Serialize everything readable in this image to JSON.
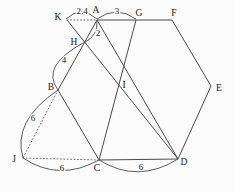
{
  "figure": {
    "canvas": {
      "width": 235,
      "height": 193
    },
    "colors": {
      "background": "#fcfcfc",
      "stroke": "#4a4a4a",
      "stroke_dotted": "#6b6b6b",
      "label": "#171717"
    },
    "points": {
      "K": {
        "x": 67,
        "y": 20
      },
      "A": {
        "x": 97,
        "y": 20
      },
      "G": {
        "x": 136,
        "y": 20
      },
      "F": {
        "x": 172,
        "y": 20
      },
      "H": {
        "x": 84.6,
        "y": 42.3
      },
      "B": {
        "x": 58,
        "y": 90
      },
      "I": {
        "x": 118,
        "y": 84.3
      },
      "E": {
        "x": 211,
        "y": 86
      },
      "J": {
        "x": 23,
        "y": 158
      },
      "C": {
        "x": 99,
        "y": 160
      },
      "D": {
        "x": 178,
        "y": 159
      }
    },
    "point_labels": [
      {
        "text": "K",
        "x": 58,
        "y": 17
      },
      {
        "text": "A",
        "x": 96,
        "y": 10
      },
      {
        "text": "G",
        "x": 139,
        "y": 13
      },
      {
        "text": "F",
        "x": 174,
        "y": 13
      },
      {
        "text": "H",
        "x": 74,
        "y": 42
      },
      {
        "text": "B",
        "x": 51,
        "y": 87
      },
      {
        "text": "I",
        "x": 124,
        "y": 85
      },
      {
        "text": "E",
        "x": 219,
        "y": 88
      },
      {
        "text": "J",
        "x": 14,
        "y": 159
      },
      {
        "text": "C",
        "x": 97,
        "y": 168
      },
      {
        "text": "D",
        "x": 184,
        "y": 162
      }
    ],
    "segments": [
      {
        "from": "A",
        "to": "F",
        "style": "solid"
      },
      {
        "from": "F",
        "to": "E",
        "style": "solid"
      },
      {
        "from": "E",
        "to": "D",
        "style": "solid"
      },
      {
        "from": "D",
        "to": "C",
        "style": "solid"
      },
      {
        "from": "C",
        "to": "B",
        "style": "solid"
      },
      {
        "from": "B",
        "to": "A",
        "style": "solid"
      },
      {
        "from": "K",
        "to": "D",
        "style": "solid"
      },
      {
        "from": "G",
        "to": "C",
        "style": "solid"
      },
      {
        "from": "A",
        "to": "D",
        "style": "solid"
      },
      {
        "from": "K",
        "to": "A",
        "style": "dotted"
      },
      {
        "from": "B",
        "to": "J",
        "style": "dotted"
      },
      {
        "from": "J",
        "to": "C",
        "style": "dotted"
      }
    ],
    "arcs": [
      {
        "name": "arc-K-A",
        "x1": 66,
        "y1": 19,
        "cx": 81,
        "cy": 5,
        "x2": 97,
        "y2": 19
      },
      {
        "name": "arc-A-G",
        "x1": 97,
        "y1": 19,
        "cx": 116,
        "cy": 5,
        "x2": 136,
        "y2": 19
      },
      {
        "name": "arc-A-H",
        "x1": 97,
        "y1": 21,
        "cx": 98,
        "cy": 36,
        "x2": 84.6,
        "y2": 42.3
      },
      {
        "name": "arc-H-B",
        "x1": 84,
        "y1": 42.5,
        "cx": 40,
        "cy": 66,
        "x2": 58,
        "y2": 90
      },
      {
        "name": "arc-B-J",
        "x1": 58,
        "y1": 90,
        "cx": 12,
        "cy": 121,
        "x2": 23,
        "y2": 158
      },
      {
        "name": "arc-J-C",
        "x1": 23,
        "y1": 158,
        "cx": 59,
        "cy": 182,
        "x2": 99,
        "y2": 160
      },
      {
        "name": "arc-C-D",
        "x1": 99,
        "y1": 160,
        "cx": 138,
        "cy": 184,
        "x2": 178,
        "y2": 159
      }
    ],
    "measure_labels": [
      {
        "segment": "K-A",
        "text": "2.4",
        "x": 82,
        "y": 11
      },
      {
        "segment": "A-G",
        "text": "3",
        "x": 117,
        "y": 11
      },
      {
        "segment": "A-H",
        "text": "2",
        "x": 98,
        "y": 33
      },
      {
        "segment": "H-B",
        "text": "4",
        "x": 64,
        "y": 60
      },
      {
        "segment": "B-J",
        "text": "6",
        "x": 33,
        "y": 118
      },
      {
        "segment": "J-C",
        "text": "6",
        "x": 62,
        "y": 168
      },
      {
        "segment": "C-D",
        "text": "6",
        "x": 141,
        "y": 167
      }
    ]
  }
}
